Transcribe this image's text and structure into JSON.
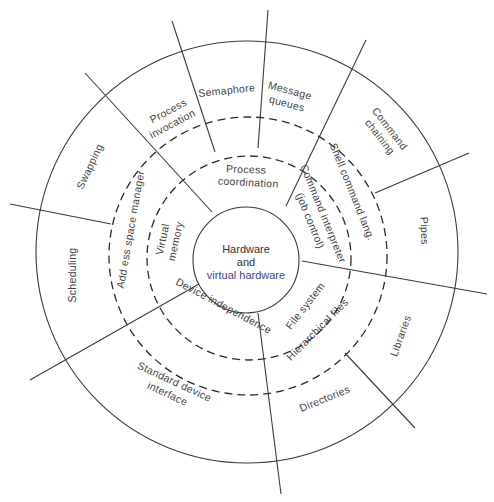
{
  "diagram": {
    "center": {
      "line1": "Hardware",
      "line2": "and",
      "line3": "virtual hardware"
    },
    "ring1": {
      "process_coordination": "Process coordination",
      "process_coordination_l1": "Process",
      "process_coordination_l2": "coordination",
      "command_interpreter_l1": "Command interpreter",
      "command_interpreter_l2": "(job control)",
      "file_system": "File system",
      "device_independence": "Device independence",
      "virtual_memory_l1": "Virtual",
      "virtual_memory_l2": "memory"
    },
    "ring2": {
      "shell_command_lang": "Shell command lang.",
      "hierarchical_files": "Hierarchical files",
      "address_space_manager": "Add ess space manager"
    },
    "ring3": {
      "process_invocation_l1": "Process",
      "process_invocation_l2": "invocation",
      "semaphore": "Semaphore",
      "message_queues_l1": "Message",
      "message_queues_l2": "queues",
      "command_chaining_l1": "Command",
      "command_chaining_l2": "chaining",
      "pipes": "Pipes",
      "libraries": "Libraries",
      "directories": "Directories",
      "standard_device_interface_l1": "Standard device",
      "standard_device_interface_l2": "interface",
      "scheduling": "Scheduling",
      "swapping": "Swapping"
    },
    "colors": {
      "line": "#3a3a3a",
      "text": "#444444",
      "accent_blue": "#3a4a8a"
    }
  }
}
